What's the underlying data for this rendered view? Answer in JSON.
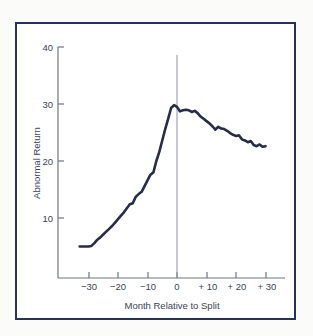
{
  "chart_data": {
    "type": "line",
    "title": "",
    "xlabel": "Month Relative to Split",
    "ylabel": "Abnormal Return",
    "xlim": [
      -33,
      31
    ],
    "ylim": [
      0,
      40
    ],
    "grid": false,
    "legend": "none",
    "xticks": [
      -30,
      -20,
      -10,
      0,
      10,
      20,
      30
    ],
    "xtick_labels": [
      "−30",
      "−20",
      "−10",
      "0",
      "+ 10",
      "+ 20",
      "+ 30"
    ],
    "yticks": [
      10,
      20,
      30,
      40
    ],
    "ytick_labels": [
      "10",
      "20",
      "30",
      "40"
    ],
    "annotations": [
      {
        "name": "split-event-line",
        "x": 0,
        "description": "vertical reference line at month 0 (split month)"
      }
    ],
    "series": [
      {
        "name": "Cumulative Abnormal Return",
        "color": "#262c4a",
        "x": [
          -33,
          -32,
          -31,
          -30,
          -29,
          -28,
          -27,
          -26,
          -25,
          -24,
          -23,
          -22,
          -21,
          -20,
          -19,
          -18,
          -17,
          -16,
          -15,
          -14,
          -13,
          -12,
          -11,
          -10,
          -9,
          -8,
          -7,
          -6,
          -5,
          -4,
          -3,
          -2,
          -1,
          0,
          1,
          2,
          3,
          4,
          5,
          6,
          7,
          8,
          9,
          10,
          11,
          12,
          13,
          14,
          15,
          16,
          17,
          18,
          19,
          20,
          21,
          22,
          23,
          24,
          25,
          26,
          27,
          28,
          29,
          30
        ],
        "values": [
          5.0,
          5.0,
          5.0,
          5.0,
          5.1,
          5.6,
          6.2,
          6.6,
          7.1,
          7.6,
          8.1,
          8.6,
          9.2,
          9.8,
          10.4,
          11.0,
          11.7,
          12.4,
          12.6,
          13.7,
          14.2,
          14.6,
          15.6,
          16.6,
          17.6,
          18.0,
          20.0,
          21.6,
          23.6,
          25.6,
          27.4,
          29.3,
          29.8,
          29.5,
          28.7,
          28.9,
          29.0,
          28.9,
          28.6,
          28.8,
          28.4,
          27.8,
          27.4,
          27.0,
          26.6,
          26.1,
          25.5,
          26.0,
          25.7,
          25.6,
          25.3,
          24.9,
          24.6,
          24.4,
          24.5,
          23.8,
          23.6,
          23.3,
          23.5,
          22.8,
          22.6,
          22.9,
          22.5,
          22.6
        ]
      }
    ]
  },
  "figure": {
    "background_color": "#fbfbfa",
    "plot_background_color": "#ffffff",
    "frame_color": "#2b3150",
    "axis_color": "#6f7486",
    "event_line_color": "#8c90a0",
    "curve_color": "#262c4a"
  }
}
